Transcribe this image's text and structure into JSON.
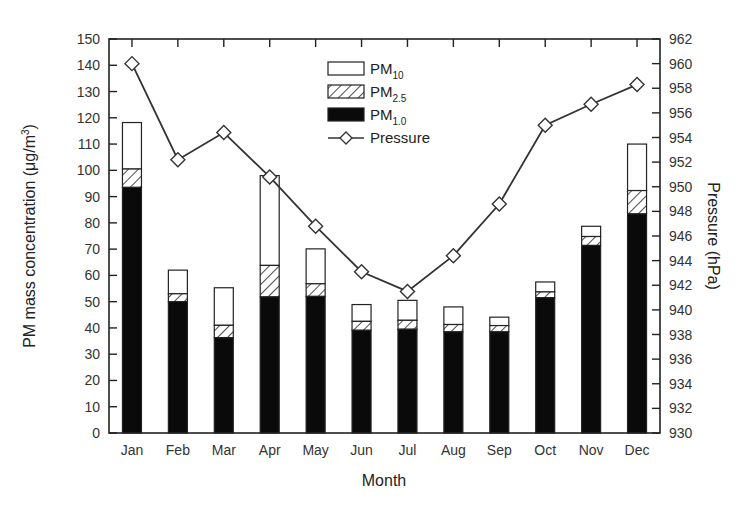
{
  "chart_data": {
    "type": "bar",
    "subtype": "stacked bar with line overlay (dual axis)",
    "title": "",
    "xlabel": "Month",
    "ylabel": "PM mass concentration (μg/m3)",
    "ylabel_right": "Pressure (hPa)",
    "categories": [
      "Jan",
      "Feb",
      "Mar",
      "Apr",
      "May",
      "Jun",
      "Jul",
      "Aug",
      "Sep",
      "Oct",
      "Nov",
      "Dec"
    ],
    "ylim": [
      0,
      150
    ],
    "yticks": [
      0,
      10,
      20,
      30,
      40,
      50,
      60,
      70,
      80,
      90,
      100,
      110,
      120,
      130,
      140,
      150
    ],
    "ylim_right": [
      930,
      962
    ],
    "yticks_right": [
      930,
      932,
      934,
      936,
      938,
      940,
      942,
      944,
      946,
      948,
      950,
      952,
      954,
      956,
      958,
      960,
      962
    ],
    "grid": false,
    "legend_position": "upper center (inside plot)",
    "series": [
      {
        "name": "PM1.0",
        "display": {
          "base": "PM",
          "sub": "1.0"
        },
        "axis": "left",
        "kind": "bar",
        "fill": "solid-black",
        "values": [
          93.5,
          50,
          36.3,
          51.8,
          52,
          39.1,
          39.5,
          38.5,
          38.5,
          51.5,
          71.4,
          83.4
        ]
      },
      {
        "name": "PM2.5",
        "display": {
          "base": "PM",
          "sub": "2.5"
        },
        "axis": "left",
        "kind": "bar",
        "fill": "hatched",
        "values": [
          100.5,
          53,
          41,
          63.8,
          56.8,
          42.5,
          42.9,
          41.3,
          40.9,
          53.7,
          74.8,
          92.3
        ],
        "note": "cumulative top of stacked segment"
      },
      {
        "name": "PM10",
        "display": {
          "base": "PM",
          "sub": "10"
        },
        "axis": "left",
        "kind": "bar",
        "fill": "white",
        "values": [
          118.2,
          62,
          55.3,
          98,
          70.1,
          48.9,
          50.5,
          48,
          44.1,
          57.5,
          78.7,
          110
        ],
        "note": "cumulative top of stacked segment (total bar height)"
      },
      {
        "name": "Pressure",
        "display": {
          "base": "Pressure",
          "sub": ""
        },
        "axis": "right",
        "kind": "line",
        "marker": "open-diamond",
        "values": [
          960,
          952.2,
          954.4,
          950.8,
          946.8,
          943.1,
          941.5,
          944.4,
          948.6,
          955,
          956.7,
          958.3
        ]
      }
    ]
  },
  "labels": {
    "xlabel": "Month",
    "ylabel_main": "PM mass concentration (μg/m",
    "ylabel_sup": "3",
    "ylabel_close": ")",
    "ylabel_right": "Pressure (hPa)"
  },
  "legend": [
    {
      "base": "PM",
      "sub": "10",
      "swatch": "white"
    },
    {
      "base": "PM",
      "sub": "2.5",
      "swatch": "hatched"
    },
    {
      "base": "PM",
      "sub": "1.0",
      "swatch": "black"
    },
    {
      "base": "Pressure",
      "sub": "",
      "swatch": "line-diamond"
    }
  ],
  "colors": {
    "axis": "#222222",
    "bar_outline": "#222222",
    "pm1_fill": "#0a0a0a",
    "pm10_fill": "#ffffff",
    "line": "#333333",
    "marker_fill": "#ffffff",
    "text": "#333333"
  }
}
